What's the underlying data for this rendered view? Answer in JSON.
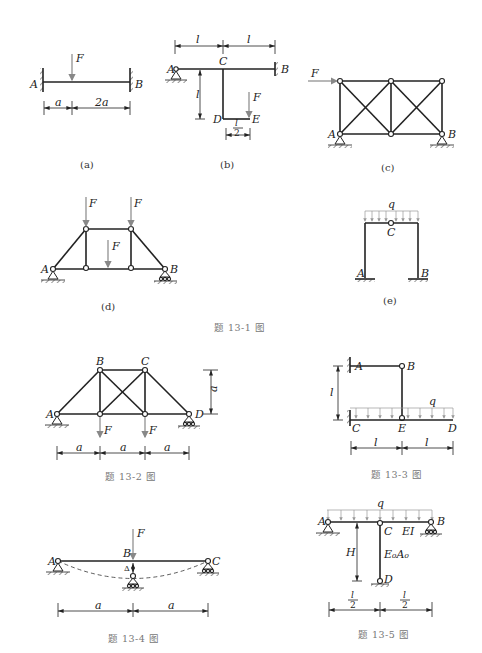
{
  "problem_13_1": {
    "caption": "题 13-1 图",
    "a": {
      "sublabel": "(a)",
      "labels": {
        "A": "A",
        "B": "B",
        "F": "F"
      },
      "dims": [
        "a",
        "2a"
      ]
    },
    "b": {
      "sublabel": "(b)",
      "labels": {
        "A": "A",
        "B": "B",
        "C": "C",
        "D": "D",
        "E": "E",
        "F": "F"
      },
      "dims": {
        "top_left": "l",
        "top_right": "l",
        "vertical": "l",
        "bottom_num": "l",
        "bottom_den": "2"
      }
    },
    "c": {
      "sublabel": "(c)",
      "labels": {
        "A": "A",
        "B": "B",
        "F": "F"
      }
    },
    "d": {
      "sublabel": "(d)",
      "labels": {
        "A": "A",
        "B": "B",
        "F1": "F",
        "F2": "F",
        "F3": "F"
      }
    },
    "e": {
      "sublabel": "(e)",
      "labels": {
        "A": "A",
        "B": "B",
        "C": "C",
        "q": "q"
      }
    }
  },
  "problem_13_2": {
    "caption": "题 13-2 图",
    "labels": {
      "A": "A",
      "B": "B",
      "C": "C",
      "D": "D",
      "F1": "F",
      "F2": "F"
    },
    "dims": {
      "height": "a",
      "spans": [
        "a",
        "a",
        "a"
      ]
    }
  },
  "problem_13_3": {
    "caption": "题 13-3 图",
    "labels": {
      "A": "A",
      "B": "B",
      "C": "C",
      "D": "D",
      "E": "E",
      "q": "q"
    },
    "dims": {
      "vertical": "l",
      "spans": [
        "l",
        "l"
      ]
    }
  },
  "problem_13_4": {
    "caption": "题 13-4 图",
    "labels": {
      "A": "A",
      "B": "B",
      "C": "C",
      "F": "F",
      "delta": "Δ"
    },
    "dims": {
      "spans": [
        "a",
        "a"
      ]
    }
  },
  "problem_13_5": {
    "caption": "题 13-5 图",
    "labels": {
      "A": "A",
      "B": "B",
      "C": "C",
      "D": "D",
      "q": "q",
      "EI": "EI",
      "E0A0": "E₀A₀",
      "H": "H"
    },
    "dims": {
      "spans_num": [
        "l",
        "l"
      ],
      "spans_den": [
        "2",
        "2"
      ]
    }
  }
}
